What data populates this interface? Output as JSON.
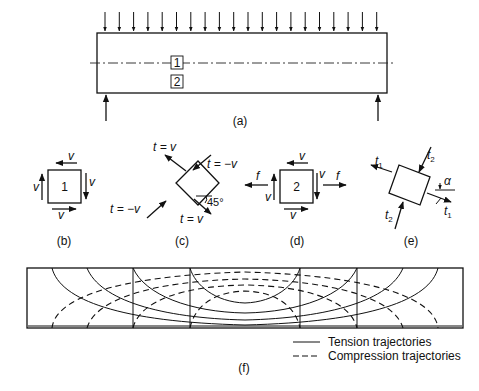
{
  "figure": {
    "panel_a": {
      "caption": "(a)",
      "element_labels": [
        "1",
        "2"
      ],
      "load_arrow_count": 20,
      "support_reactions": 2
    },
    "panel_b": {
      "caption": "(b)",
      "element_label": "1",
      "shear_labels": [
        "v",
        "v",
        "v",
        "v"
      ]
    },
    "panel_c": {
      "caption": "(c)",
      "labels": [
        "t = v",
        "t = −v",
        "t = −v",
        "t = v"
      ],
      "angle": "45°"
    },
    "panel_d": {
      "caption": "(d)",
      "element_label": "2",
      "shear_labels": [
        "v",
        "v",
        "v",
        "v"
      ],
      "normal_labels": [
        "f",
        "f"
      ]
    },
    "panel_e": {
      "caption": "(e)",
      "labels": [
        "t1",
        "t2",
        "t2",
        "t1"
      ],
      "angle": "α"
    },
    "panel_f": {
      "caption": "(f)",
      "legend": [
        {
          "style": "solid",
          "label": "Tension trajectories"
        },
        {
          "style": "dashed",
          "label": "Compression trajectories"
        }
      ]
    }
  }
}
